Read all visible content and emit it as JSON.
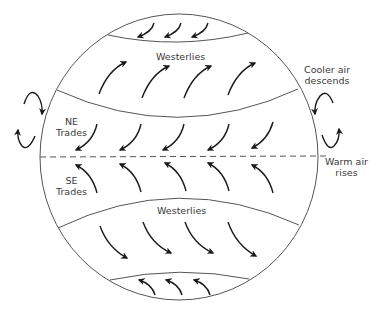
{
  "diagram": {
    "stroke_color": "#555555",
    "arrow_color": "#1a1a1a",
    "labels": {
      "westerlies_north": "Westerlies",
      "westerlies_south": "Westerlies",
      "ne_trades_line1": "NE",
      "ne_trades_line2": "Trades",
      "se_trades_line1": "SE",
      "se_trades_line2": "Trades",
      "cooler_air_line1": "Cooler air",
      "cooler_air_line2": "descends",
      "warm_air_line1": "Warm air",
      "warm_air_line2": "rises"
    },
    "bands": [
      {
        "name": "north-polar-easterlies",
        "arrow_direction": "southwest",
        "arrow_count": 3
      },
      {
        "name": "north-westerlies",
        "arrow_direction": "northeast",
        "arrow_count": 4
      },
      {
        "name": "ne-trades",
        "arrow_direction": "southwest",
        "arrow_count": 5
      },
      {
        "name": "equator",
        "style": "dashed"
      },
      {
        "name": "se-trades",
        "arrow_direction": "northwest",
        "arrow_count": 5
      },
      {
        "name": "south-westerlies",
        "arrow_direction": "southeast",
        "arrow_count": 4
      },
      {
        "name": "south-polar-easterlies",
        "arrow_direction": "northwest",
        "arrow_count": 3
      }
    ]
  }
}
